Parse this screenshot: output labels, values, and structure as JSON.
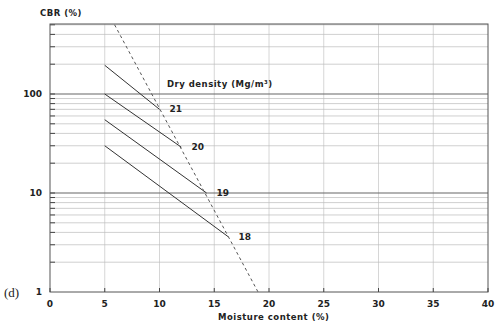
{
  "panel_label": "(d)",
  "chart_data": {
    "type": "line",
    "title": "",
    "xlabel": "Moisture content (%)",
    "ylabel": "CBR (%)",
    "xlim": [
      0,
      40
    ],
    "ylim": [
      1,
      500
    ],
    "yscale": "log",
    "x_ticks": [
      0,
      5,
      10,
      15,
      20,
      25,
      30,
      35,
      40
    ],
    "y_tick_labels": [
      "1",
      "10",
      "100"
    ],
    "grid": true,
    "legend_title": "Dry density (Mg/m³)",
    "series": [
      {
        "name": "21",
        "x": [
          5,
          10
        ],
        "y": [
          195,
          70
        ],
        "style": "solid"
      },
      {
        "name": "20",
        "x": [
          5,
          12
        ],
        "y": [
          100,
          29
        ],
        "style": "solid"
      },
      {
        "name": "19",
        "x": [
          5,
          14.3
        ],
        "y": [
          55,
          10
        ],
        "style": "solid"
      },
      {
        "name": "18",
        "x": [
          5,
          16.3
        ],
        "y": [
          30,
          3.6
        ],
        "style": "solid"
      },
      {
        "name": "boundary",
        "x": [
          5.9,
          19
        ],
        "y": [
          500,
          1
        ],
        "style": "dashed"
      }
    ]
  }
}
